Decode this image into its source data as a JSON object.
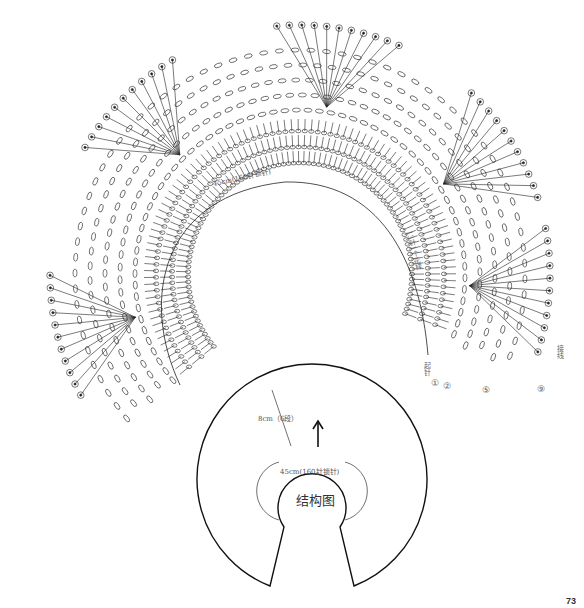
{
  "chart_labels": {
    "neckline": "45cm(160针锁针)",
    "side_note": "13针1个花样",
    "start_label": "起针",
    "join_label": "接线",
    "row_markers": [
      "①",
      "②",
      "⑤",
      "⑨"
    ]
  },
  "structure_diagram": {
    "title": "结构图",
    "depth_label": "8cm（6段）",
    "neck_label": "45cm(160针锁针)"
  },
  "page_number": "73",
  "colors": {
    "line": "#222222",
    "text": "#555555",
    "background": "#ffffff"
  }
}
